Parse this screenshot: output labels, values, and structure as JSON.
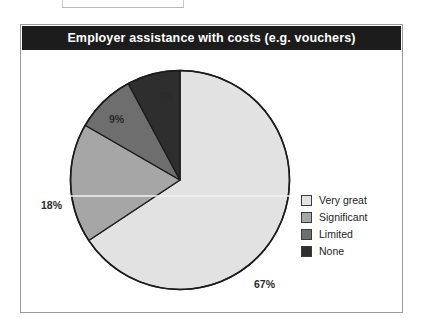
{
  "page": {
    "top_fragment_text": "GUIDANCE AND SUPPORT"
  },
  "panel": {
    "title": "Employer assistance with costs (e.g. vouchers)"
  },
  "colors": {
    "title_bar_background": "#1c1c1c",
    "title_bar_text": "#ffffff",
    "panel_border": "#9a9a9a",
    "page_background": "#ffffff",
    "slice_outline": "#1c1c1c",
    "very_great": "#e2e2e2",
    "significant": "#a6a6a6",
    "limited": "#6e6e6e",
    "none": "#2e2e2e"
  },
  "legend": {
    "items": [
      {
        "label": "Very great",
        "color": "#e2e2e2"
      },
      {
        "label": "Significant",
        "color": "#a6a6a6"
      },
      {
        "label": "Limited",
        "color": "#6e6e6e"
      },
      {
        "label": "None",
        "color": "#2e2e2e"
      }
    ]
  },
  "labels": {
    "very_great": "67%",
    "significant": "18%",
    "limited": "9%",
    "none": "8%"
  },
  "chart_data": {
    "type": "pie",
    "title": "Employer assistance with costs (e.g. vouchers)",
    "xlabel": "",
    "ylabel": "",
    "categories": [
      "Very great",
      "Significant",
      "Limited",
      "None"
    ],
    "values": [
      67,
      18,
      9,
      8
    ],
    "value_labels": [
      "67%",
      "18%",
      "9%",
      "8%"
    ],
    "unit": "percent",
    "total": 102,
    "start_angle_deg": 0,
    "direction": "clockwise",
    "legend_position": "right",
    "grid": false,
    "colors": [
      "#e2e2e2",
      "#a6a6a6",
      "#6e6e6e",
      "#2e2e2e"
    ]
  }
}
